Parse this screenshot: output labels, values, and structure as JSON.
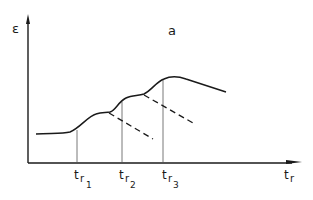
{
  "diagram": {
    "panel_label": "a",
    "y_axis_label": "ε",
    "x_axis_label": {
      "base": "t",
      "sub": "r"
    },
    "markers": [
      {
        "base": "t",
        "sub": "r",
        "subsub": "1"
      },
      {
        "base": "t",
        "sub": "r",
        "subsub": "2"
      },
      {
        "base": "t",
        "sub": "r",
        "subsub": "3"
      }
    ],
    "curve_description": "strain rises in three steps at t_r1, t_r2, t_r3, then decreases; dashed extrapolations show decay after first two steps",
    "colors": {
      "line": "#1a1a1a",
      "background": "#ffffff"
    }
  }
}
